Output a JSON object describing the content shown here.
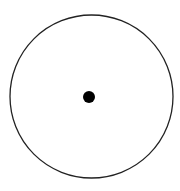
{
  "diagram": {
    "canvas": {
      "width": 180,
      "height": 191,
      "background": "#ffffff"
    },
    "outer_circle": {
      "cx": 91.5,
      "cy": 96.5,
      "r": 81.5,
      "stroke": "#222222",
      "stroke_width": 1.3,
      "fill": "none"
    },
    "center_dot": {
      "cx": 89,
      "cy": 97,
      "r": 6,
      "fill": "#000000"
    }
  }
}
